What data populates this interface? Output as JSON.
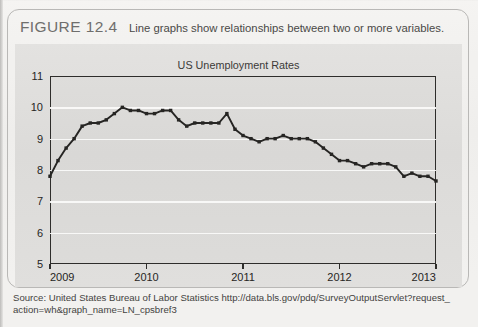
{
  "figure": {
    "label": "FIGURE 12.4",
    "caption": "Line graphs show relationships between two or more variables."
  },
  "source": {
    "line1": "Source: United States Bureau of Labor Statistics http://data.bls.gov/pdq/SurveyOutputServlet?request_",
    "line2": "action=wh&graph_name=LN_cpsbref3"
  },
  "colors": {
    "line": "#262523",
    "axis": "#2e2d2b",
    "grid": "#fbfbfa",
    "plot_background": "#dedddb",
    "page_background": "#f2f1ef"
  },
  "chart_data": {
    "type": "line",
    "title": "US Unemployment Rates",
    "xlabel": "",
    "ylabel": "",
    "xlim": [
      2009.0,
      2013.0
    ],
    "ylim": [
      5,
      11
    ],
    "yticks": [
      5,
      6,
      7,
      8,
      9,
      10,
      11
    ],
    "xticks": [
      2009,
      2010,
      2011,
      2012,
      2013
    ],
    "xtick_labels": [
      "2009",
      "2010",
      "2011",
      "2012",
      "2013"
    ],
    "ytick_labels": [
      "5",
      "6",
      "7",
      "8",
      "9",
      "10",
      "11"
    ],
    "grid": true,
    "grid_axis": "y",
    "legend": false,
    "markers": true,
    "series": [
      {
        "name": "US Unemployment Rate",
        "x": [
          2009.0,
          2009.083,
          2009.167,
          2009.25,
          2009.333,
          2009.417,
          2009.5,
          2009.583,
          2009.667,
          2009.75,
          2009.833,
          2009.917,
          2010.0,
          2010.083,
          2010.167,
          2010.25,
          2010.333,
          2010.417,
          2010.5,
          2010.583,
          2010.667,
          2010.75,
          2010.833,
          2010.917,
          2011.0,
          2011.083,
          2011.167,
          2011.25,
          2011.333,
          2011.417,
          2011.5,
          2011.583,
          2011.667,
          2011.75,
          2011.833,
          2011.917,
          2012.0,
          2012.083,
          2012.167,
          2012.25,
          2012.333,
          2012.417,
          2012.5,
          2012.583,
          2012.667,
          2012.75,
          2012.833,
          2012.917,
          2013.0
        ],
        "values": [
          7.8,
          8.3,
          8.7,
          9.0,
          9.4,
          9.5,
          9.5,
          9.6,
          9.8,
          10.0,
          9.9,
          9.9,
          9.8,
          9.8,
          9.9,
          9.9,
          9.6,
          9.4,
          9.5,
          9.5,
          9.5,
          9.5,
          9.8,
          9.3,
          9.1,
          9.0,
          8.9,
          9.0,
          9.0,
          9.1,
          9.0,
          9.0,
          9.0,
          8.9,
          8.7,
          8.5,
          8.3,
          8.3,
          8.2,
          8.1,
          8.2,
          8.2,
          8.2,
          8.1,
          7.8,
          7.9,
          7.8,
          7.8,
          7.65
        ]
      }
    ]
  }
}
